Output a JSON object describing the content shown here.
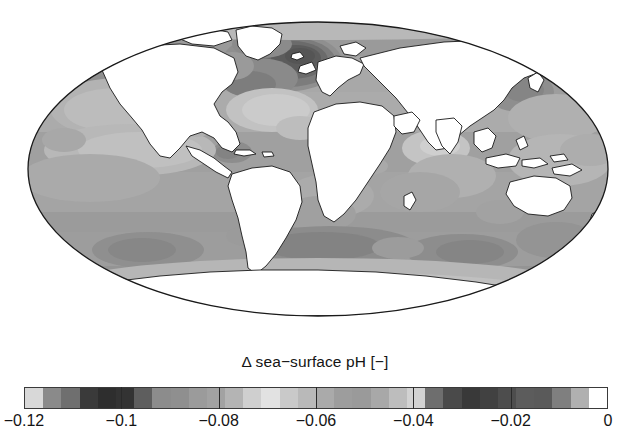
{
  "figure": {
    "kind": "map",
    "projection": "Mollweide",
    "background_color": "#ffffff",
    "land_color": "#ffffff",
    "outline_color": "#1a1a1a"
  },
  "colorbar": {
    "title": "Δ sea−surface pH [−]",
    "orientation": "horizontal",
    "vmin": -0.12,
    "vmax": 0,
    "tick_labels": [
      "−0.12",
      "−0.1",
      "−0.08",
      "−0.06",
      "−0.04",
      "−0.02",
      "0"
    ],
    "tick_values": [
      -0.12,
      -0.1,
      -0.08,
      -0.06,
      -0.04,
      -0.02,
      0
    ],
    "segment_colors": [
      "#d8d8d8",
      "#8a8a8a",
      "#6f6f6f",
      "#3a3a3a",
      "#2e2e2e",
      "#333333",
      "#5e5e5e",
      "#8c8c8c",
      "#8f8f8f",
      "#9b9b9b",
      "#a2a2a2",
      "#b4b4b4",
      "#cfcfcf",
      "#e2e2e2",
      "#c9c9c9",
      "#b9b9b9",
      "#aaaaaa",
      "#9d9d9d",
      "#9a9a9a",
      "#a8a8a8",
      "#bdbdbd",
      "#d2d2d2",
      "#6e6e6e",
      "#4a4a4a",
      "#393939",
      "#414141",
      "#4d4d4d",
      "#5c5c5c",
      "#5a5a5a",
      "#7f7f7f",
      "#b0b0b0",
      "#ffffff"
    ]
  },
  "chart_data": {
    "type": "heatmap",
    "title": "Δ sea−surface pH [−]",
    "xlabel": "",
    "ylabel": "",
    "colorbar_label": "Δ sea−surface pH [−]",
    "colormap": "grayscale (dark = strong negative, light = near zero)",
    "value_range": [
      -0.12,
      0
    ],
    "tick_labels": [
      "−0.12",
      "−0.1",
      "−0.08",
      "−0.06",
      "−0.04",
      "−0.02",
      "0"
    ],
    "grid": false,
    "legend_position": "bottom",
    "projection": "Mollweide",
    "regions": [
      {
        "name": "North Atlantic (subpolar / Norwegian Sea)",
        "value": -0.105
      },
      {
        "name": "North Atlantic subtropical gyre",
        "value": -0.075
      },
      {
        "name": "Labrador Sea",
        "value": -0.09
      },
      {
        "name": "Arctic margin",
        "value": -0.085
      },
      {
        "name": "North Pacific subpolar",
        "value": -0.055
      },
      {
        "name": "North Pacific subtropical gyre",
        "value": -0.062
      },
      {
        "name": "Equatorial Pacific upwelling",
        "value": -0.045
      },
      {
        "name": "Eastern tropical Pacific",
        "value": -0.04
      },
      {
        "name": "Tropical Atlantic",
        "value": -0.06
      },
      {
        "name": "Arabian Sea / Bay of Bengal",
        "value": -0.05
      },
      {
        "name": "Indian Ocean subtropics",
        "value": -0.06
      },
      {
        "name": "South Atlantic subtropical gyre",
        "value": -0.065
      },
      {
        "name": "South Pacific subtropical gyre",
        "value": -0.06
      },
      {
        "name": "Southern Ocean (ACC belt)",
        "value": -0.072
      },
      {
        "name": "Antarctic coastal / Weddell & Ross",
        "value": -0.05
      },
      {
        "name": "Kuroshio / NW Pacific",
        "value": -0.08
      },
      {
        "name": "Global ocean mean",
        "value": -0.065
      }
    ]
  }
}
